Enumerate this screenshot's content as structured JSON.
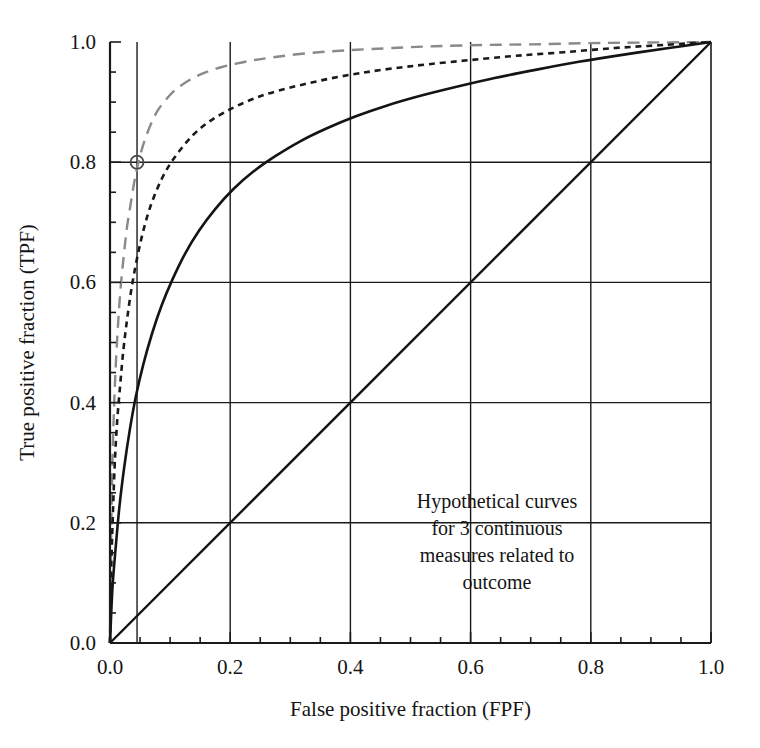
{
  "figure": {
    "background_color": "#ffffff",
    "ink_color": "#141414"
  },
  "annotation": {
    "name": "curve-description",
    "lines": [
      "Hypothetical curves",
      "for 3 continuous",
      "measures related to",
      "outcome"
    ]
  },
  "chart_data": {
    "type": "line",
    "title": "",
    "subtitle": "",
    "xlabel": "False positive fraction (FPF)",
    "ylabel": "True positive fraction (TPF)",
    "xlim": [
      0.0,
      1.0
    ],
    "ylim": [
      0.0,
      1.0
    ],
    "xticks": [
      0.0,
      0.2,
      0.4,
      0.6,
      0.8,
      1.0
    ],
    "yticks": [
      0.0,
      0.2,
      0.4,
      0.6,
      0.8,
      1.0
    ],
    "xtick_labels": [
      "0.0",
      "0.2",
      "0.4",
      "0.6",
      "0.8",
      "1.0"
    ],
    "ytick_labels": [
      "0.0",
      "0.2",
      "0.4",
      "0.6",
      "0.8",
      "1.0"
    ],
    "minor_tick_step": 0.05,
    "grid": true,
    "grid_x": [
      0.045,
      0.2,
      0.4,
      0.6,
      0.8
    ],
    "grid_y": [
      0.2,
      0.4,
      0.6,
      0.8
    ],
    "grid_color": "#1a1a1a",
    "legend": "none",
    "annotations": [
      {
        "kind": "marker",
        "shape": "circle-open",
        "name": "operating-point-marker",
        "x": 0.045,
        "y": 0.8,
        "color": "#4a4a4a"
      }
    ],
    "series": [
      {
        "name": "Measure 1 (highest accuracy)",
        "style": "long-dash",
        "color": "#8a8a8a",
        "width": 2.4,
        "points": [
          [
            0.0,
            0.0
          ],
          [
            0.002,
            0.18
          ],
          [
            0.004,
            0.3
          ],
          [
            0.007,
            0.4
          ],
          [
            0.01,
            0.47
          ],
          [
            0.014,
            0.54
          ],
          [
            0.018,
            0.595
          ],
          [
            0.023,
            0.645
          ],
          [
            0.028,
            0.69
          ],
          [
            0.034,
            0.728
          ],
          [
            0.04,
            0.765
          ],
          [
            0.045,
            0.79
          ],
          [
            0.052,
            0.818
          ],
          [
            0.06,
            0.843
          ],
          [
            0.07,
            0.868
          ],
          [
            0.08,
            0.887
          ],
          [
            0.092,
            0.903
          ],
          [
            0.105,
            0.917
          ],
          [
            0.12,
            0.929
          ],
          [
            0.14,
            0.941
          ],
          [
            0.16,
            0.95
          ],
          [
            0.185,
            0.958
          ],
          [
            0.21,
            0.964
          ],
          [
            0.24,
            0.97
          ],
          [
            0.275,
            0.975
          ],
          [
            0.315,
            0.98
          ],
          [
            0.36,
            0.984
          ],
          [
            0.41,
            0.987
          ],
          [
            0.47,
            0.99
          ],
          [
            0.54,
            0.993
          ],
          [
            0.62,
            0.995
          ],
          [
            0.7,
            0.996
          ],
          [
            0.79,
            0.998
          ],
          [
            0.88,
            0.999
          ],
          [
            1.0,
            1.0
          ]
        ]
      },
      {
        "name": "Measure 2 (intermediate accuracy)",
        "style": "short-dash",
        "color": "#1a1a1a",
        "width": 2.6,
        "points": [
          [
            0.0,
            0.0
          ],
          [
            0.002,
            0.12
          ],
          [
            0.005,
            0.22
          ],
          [
            0.008,
            0.3
          ],
          [
            0.012,
            0.37
          ],
          [
            0.017,
            0.43
          ],
          [
            0.022,
            0.485
          ],
          [
            0.028,
            0.535
          ],
          [
            0.035,
            0.585
          ],
          [
            0.043,
            0.63
          ],
          [
            0.052,
            0.672
          ],
          [
            0.062,
            0.71
          ],
          [
            0.073,
            0.742
          ],
          [
            0.086,
            0.772
          ],
          [
            0.1,
            0.797
          ],
          [
            0.118,
            0.822
          ],
          [
            0.138,
            0.845
          ],
          [
            0.16,
            0.864
          ],
          [
            0.185,
            0.88
          ],
          [
            0.212,
            0.894
          ],
          [
            0.245,
            0.908
          ],
          [
            0.28,
            0.919
          ],
          [
            0.32,
            0.929
          ],
          [
            0.365,
            0.939
          ],
          [
            0.415,
            0.948
          ],
          [
            0.47,
            0.956
          ],
          [
            0.53,
            0.963
          ],
          [
            0.6,
            0.97
          ],
          [
            0.675,
            0.977
          ],
          [
            0.755,
            0.983
          ],
          [
            0.84,
            0.99
          ],
          [
            0.92,
            0.995
          ],
          [
            1.0,
            1.0
          ]
        ]
      },
      {
        "name": "Measure 3 (lowest accuracy)",
        "style": "solid",
        "color": "#141414",
        "width": 2.6,
        "points": [
          [
            0.0,
            0.0
          ],
          [
            0.004,
            0.09
          ],
          [
            0.01,
            0.165
          ],
          [
            0.016,
            0.23
          ],
          [
            0.024,
            0.295
          ],
          [
            0.033,
            0.355
          ],
          [
            0.043,
            0.41
          ],
          [
            0.055,
            0.462
          ],
          [
            0.07,
            0.515
          ],
          [
            0.086,
            0.562
          ],
          [
            0.104,
            0.605
          ],
          [
            0.125,
            0.648
          ],
          [
            0.148,
            0.686
          ],
          [
            0.175,
            0.722
          ],
          [
            0.205,
            0.755
          ],
          [
            0.238,
            0.784
          ],
          [
            0.275,
            0.81
          ],
          [
            0.315,
            0.834
          ],
          [
            0.36,
            0.856
          ],
          [
            0.408,
            0.876
          ],
          [
            0.46,
            0.894
          ],
          [
            0.515,
            0.91
          ],
          [
            0.575,
            0.925
          ],
          [
            0.64,
            0.94
          ],
          [
            0.71,
            0.954
          ],
          [
            0.78,
            0.967
          ],
          [
            0.855,
            0.979
          ],
          [
            0.93,
            0.99
          ],
          [
            1.0,
            1.0
          ]
        ]
      },
      {
        "name": "Chance diagonal",
        "style": "solid",
        "color": "#141414",
        "width": 2.4,
        "points": [
          [
            0.0,
            0.0
          ],
          [
            1.0,
            1.0
          ]
        ]
      }
    ]
  }
}
